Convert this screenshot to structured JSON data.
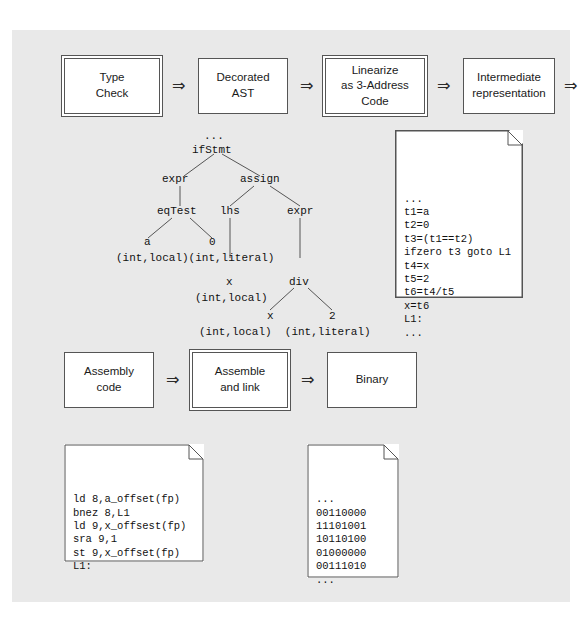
{
  "diagram": {
    "background_color": "#e9e9e9",
    "box_color": "#ffffff",
    "line_color": "#555555"
  },
  "pipeline_top": {
    "arrow_glyph": "⇒",
    "stages": [
      {
        "label": "Type\nCheck",
        "kind": "phase",
        "border": "double"
      },
      {
        "label": "Decorated\nAST",
        "kind": "data",
        "border": "single"
      },
      {
        "label": "Linearize\nas 3-Address\nCode",
        "kind": "phase",
        "border": "double"
      },
      {
        "label": "Intermediate\nrepresentation",
        "kind": "data",
        "border": "single"
      }
    ]
  },
  "pipeline_bottom": {
    "arrow_glyph": "⇒",
    "stages": [
      {
        "label": "Assembly\ncode",
        "kind": "data",
        "border": "single"
      },
      {
        "label": "Assemble\nand link",
        "kind": "phase",
        "border": "double"
      },
      {
        "label": "Binary",
        "kind": "data",
        "border": "single"
      }
    ]
  },
  "ast": {
    "ellipsis_top": "...",
    "nodes": {
      "root": "ifStmt",
      "expr_left": "expr",
      "assign": "assign",
      "eqTest": "eqTest",
      "lhs": "lhs",
      "expr_right": "expr",
      "a": "a",
      "zero": "0",
      "x_lhs": "x",
      "div": "div",
      "x_div": "x",
      "two": "2"
    },
    "annotations": {
      "eq_operands": "(int,local)(int,literal)",
      "lhs_type": "(int,local)",
      "div_operands": "(int,local)  (int,literal)"
    }
  },
  "three_address_code": {
    "lines": [
      "...",
      "t1=a",
      "t2=0",
      "t3=(t1==t2)",
      "ifzero t3 goto L1",
      "t4=x",
      "t5=2",
      "t6=t4/t5",
      "x=t6",
      "L1:",
      "..."
    ]
  },
  "assembly_code": {
    "lines": [
      "ld 8,a_offset(fp)",
      "bnez 8,L1",
      "ld 9,x_offsest(fp)",
      "sra 9,1",
      "st 9,x_offset(fp)",
      "L1:"
    ]
  },
  "binary_code": {
    "lines": [
      "...",
      "00110000",
      "11101001",
      "10110100",
      "01000000",
      "00111010",
      "..."
    ]
  }
}
